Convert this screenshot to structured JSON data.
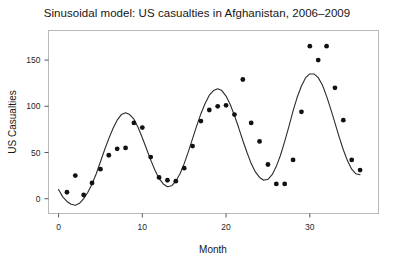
{
  "chart_data": {
    "type": "scatter",
    "title": "Sinusoidal model: US casualties in Afghanistan, 2006–2009",
    "xlabel": "Month",
    "ylabel": "US Casualties",
    "xlim": [
      -1.2,
      38.2
    ],
    "ylim": [
      -16,
      182
    ],
    "xticks": [
      0,
      10,
      20,
      30
    ],
    "xtick_labels": [
      "0",
      "10",
      "20",
      "30"
    ],
    "yticks": [
      0,
      50,
      100,
      150
    ],
    "ytick_labels": [
      "0",
      "50",
      "100",
      "150"
    ],
    "grid": false,
    "legend": null,
    "series": [
      {
        "name": "US casualties (observed)",
        "type": "scatter",
        "marker": "filled-circle",
        "color": "#111111",
        "x": [
          1,
          2,
          3,
          4,
          5,
          6,
          7,
          8,
          9,
          10,
          11,
          12,
          13,
          14,
          15,
          16,
          17,
          18,
          19,
          20,
          21,
          22,
          23,
          24,
          25,
          26,
          27,
          28,
          29,
          30,
          31,
          32,
          33,
          34,
          35,
          36
        ],
        "y": [
          7,
          25,
          4,
          17,
          32,
          47,
          54,
          55,
          82,
          77,
          45,
          23,
          20,
          19,
          33,
          57,
          84,
          96,
          100,
          101,
          91,
          129,
          82,
          62,
          37,
          16,
          16,
          42,
          94,
          165,
          150,
          165,
          120,
          85,
          42,
          31
        ]
      },
      {
        "name": "Sinusoidal model fit",
        "type": "line",
        "color": "#2b2b2b",
        "equation_hint": "amplitude-modulated sinusoid, period ≈ 12 months",
        "x": [
          0.0,
          0.5,
          1.0,
          1.5,
          2.0,
          2.5,
          3.0,
          3.5,
          4.0,
          4.5,
          5.0,
          5.5,
          6.0,
          6.5,
          7.0,
          7.5,
          8.0,
          8.5,
          9.0,
          9.5,
          10.0,
          10.5,
          11.0,
          11.5,
          12.0,
          12.5,
          13.0,
          13.5,
          14.0,
          14.5,
          15.0,
          15.5,
          16.0,
          16.5,
          17.0,
          17.5,
          18.0,
          18.5,
          19.0,
          19.5,
          20.0,
          20.5,
          21.0,
          21.5,
          22.0,
          22.5,
          23.0,
          23.5,
          24.0,
          24.5,
          25.0,
          25.5,
          26.0,
          26.5,
          27.0,
          27.5,
          28.0,
          28.5,
          29.0,
          29.5,
          30.0,
          30.5,
          31.0,
          31.5,
          32.0,
          32.5,
          33.0,
          33.5,
          34.0,
          34.5,
          35.0,
          35.5,
          36.0
        ],
        "y": [
          10,
          2,
          -3,
          -6,
          -7,
          -5,
          0,
          7,
          16,
          27,
          40,
          53,
          65,
          76,
          85,
          91,
          93,
          91,
          86,
          77,
          66,
          54,
          42,
          31,
          22,
          16,
          13,
          14,
          19,
          27,
          38,
          51,
          65,
          79,
          92,
          103,
          112,
          117,
          119,
          117,
          111,
          102,
          90,
          77,
          63,
          50,
          38,
          29,
          23,
          20,
          21,
          26,
          35,
          47,
          62,
          78,
          95,
          110,
          122,
          131,
          135,
          135,
          131,
          123,
          111,
          97,
          82,
          67,
          53,
          41,
          32,
          27,
          26
        ]
      }
    ]
  },
  "axes": {
    "x_axis_name": "Month",
    "y_axis_name": "US Casualties"
  }
}
